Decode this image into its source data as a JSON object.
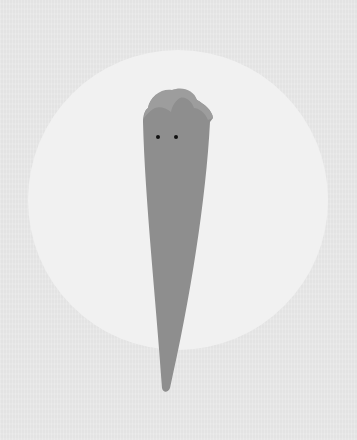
{
  "illustration": {
    "description": "Gray elongated cone-shaped creature with two dot eyes in front of a pale circle",
    "colors": {
      "background": "#e3e3e3",
      "circle": "#f1f1f1",
      "body": "#8e8e8e",
      "head_cap": "#9d9d9d",
      "eyes": "#111111"
    },
    "circle": {
      "cx": 178,
      "cy": 200,
      "r": 150
    },
    "eyes": [
      {
        "cx": 158,
        "cy": 137,
        "r": 2
      },
      {
        "cx": 176,
        "cy": 137,
        "r": 2
      }
    ],
    "tip": {
      "x": 165,
      "y": 392
    }
  }
}
